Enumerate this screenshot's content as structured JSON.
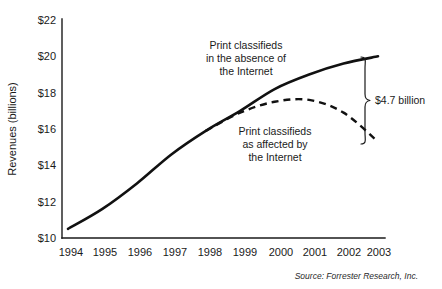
{
  "chart_data": {
    "type": "line",
    "title": "",
    "xlabel": "",
    "ylabel": "Revenues (billions)",
    "categories": [
      "1994",
      "1995",
      "1996",
      "1997",
      "1998",
      "1999",
      "2000",
      "2001",
      "2002",
      "2003"
    ],
    "x": [
      1994,
      1995,
      1996,
      1997,
      1998,
      1999,
      2000,
      2001,
      2002,
      2003
    ],
    "ylim": [
      10,
      22
    ],
    "xlim": [
      1994,
      2003
    ],
    "y_ticks": [
      "$10",
      "$12",
      "$14",
      "$16",
      "$18",
      "$20",
      "$22"
    ],
    "y_tick_values": [
      10,
      12,
      14,
      16,
      18,
      20,
      22
    ],
    "grid": false,
    "legend": "annotations",
    "series": [
      {
        "name": "Print classifieds in the absence of the Internet",
        "style": "solid",
        "values": [
          10.5,
          11.6,
          13.0,
          14.6,
          15.9,
          17.0,
          18.2,
          19.0,
          19.6,
          20.0
        ]
      },
      {
        "name": "Print classifieds as affected by the Internet",
        "style": "dashed",
        "values": [
          10.5,
          11.6,
          13.0,
          14.6,
          15.9,
          16.9,
          17.5,
          17.6,
          16.9,
          15.3
        ]
      }
    ],
    "annotations": [
      {
        "name": "solid-series-label",
        "lines": [
          "Print classifieds",
          "in the absence of",
          "the Internet"
        ]
      },
      {
        "name": "dashed-series-label",
        "lines": [
          "Print classifieds",
          "as affected by",
          "the Internet"
        ]
      },
      {
        "name": "gap-label",
        "text": "$4.7 billion",
        "value": 4.7,
        "from": 15.3,
        "to": 20.0
      }
    ],
    "source": "Source: Forrester Research, Inc.",
    "colors": {
      "background": "#ffffff",
      "ink": "#111111",
      "axis": "#1a1a1a"
    }
  }
}
